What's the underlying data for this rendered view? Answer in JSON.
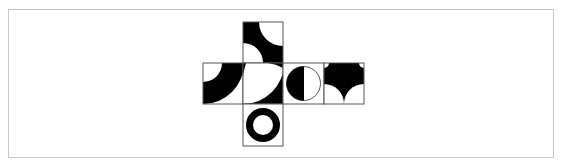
{
  "figure": {
    "type": "cube-net-puzzle",
    "cell_size": 40,
    "origin": [
      203,
      22
    ],
    "stroke_color": "#555555",
    "fill_color": "#000000",
    "background_color": "#ffffff",
    "frame_color": "#c8c8c8",
    "faces": [
      {
        "name": "top",
        "col": 1,
        "row": 0,
        "pattern": "black square with white quarter-circles at top-right and bottom-left corners"
      },
      {
        "name": "left",
        "col": 0,
        "row": 1,
        "pattern": "quarter annulus centered at top-left corner"
      },
      {
        "name": "front",
        "col": 1,
        "row": 1,
        "pattern": "white with black region at bottom-right outside arc centered top-left"
      },
      {
        "name": "right",
        "col": 2,
        "row": 1,
        "pattern": "circle split vertically, left half black"
      },
      {
        "name": "back",
        "col": 3,
        "row": 1,
        "pattern": "black top with white quarter-circles at bottom corners forming a point"
      },
      {
        "name": "bottom",
        "col": 1,
        "row": 2,
        "pattern": "black ring"
      }
    ]
  }
}
